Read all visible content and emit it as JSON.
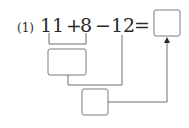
{
  "problem": {
    "number_label": "(1)",
    "expression": {
      "term1": "11",
      "op1": "+",
      "term2": "8",
      "op2": "−",
      "term3": "12",
      "equals": "="
    },
    "answer_box_value": "",
    "step1_box_value": "",
    "step2_box_value": ""
  },
  "colors": {
    "text": "#2a2a2a",
    "line": "#6e6e6e",
    "box_border": "#7a7a7a"
  }
}
